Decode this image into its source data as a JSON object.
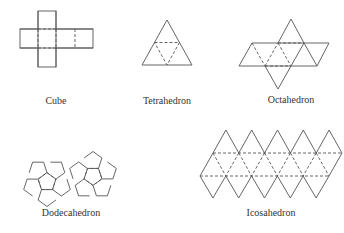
{
  "figure": {
    "nets": [
      {
        "id": "cube",
        "label": "Cube"
      },
      {
        "id": "tetrahedron",
        "label": "Tetrahedron"
      },
      {
        "id": "octahedron",
        "label": "Octahedron"
      },
      {
        "id": "dodecahedron",
        "label": "Dodecahedron"
      },
      {
        "id": "icosahedron",
        "label": "Icosahedron"
      }
    ],
    "line_color": "#555555",
    "text_color": "#333333"
  }
}
